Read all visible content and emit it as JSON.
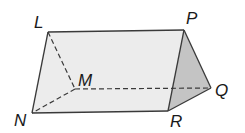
{
  "figure": {
    "type": "triangular-prism",
    "vertices": {
      "L": {
        "label": "L",
        "x": 48,
        "y": 32,
        "lx": 34,
        "ly": 28
      },
      "P": {
        "label": "P",
        "x": 184,
        "y": 30,
        "lx": 186,
        "ly": 24
      },
      "M": {
        "label": "M",
        "x": 75,
        "y": 89,
        "lx": 78,
        "ly": 86
      },
      "Q": {
        "label": "Q",
        "x": 211,
        "y": 88,
        "lx": 215,
        "ly": 96
      },
      "N": {
        "label": "N",
        "x": 32,
        "y": 113,
        "lx": 14,
        "ly": 126
      },
      "R": {
        "label": "R",
        "x": 168,
        "y": 111,
        "lx": 170,
        "ly": 127
      }
    },
    "colors": {
      "front_face": "#ececec",
      "end_face": "#c4c4c4",
      "edge": "#3a3a3a",
      "background": "#ffffff"
    },
    "hidden_edges": [
      "LM",
      "MN",
      "MQ"
    ],
    "visible_edges": [
      "LP",
      "LN",
      "NR",
      "PR",
      "PQ",
      "RQ"
    ]
  }
}
